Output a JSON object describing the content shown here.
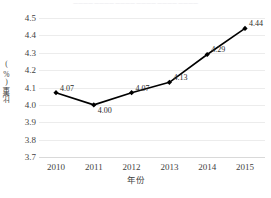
{
  "top_strip": {
    "text": "一一一一一一一一一一一一一一一一一一一一一一一一"
  },
  "chart_data": {
    "type": "line",
    "title": "",
    "subtitle": "",
    "xlabel": "年份",
    "ylabel": "比重(%)",
    "categories": [
      "2010",
      "2011",
      "2012",
      "2013",
      "2014",
      "2015"
    ],
    "x": [
      2010,
      2011,
      2012,
      2013,
      2014,
      2015
    ],
    "values": [
      4.07,
      4.0,
      4.07,
      4.13,
      4.29,
      4.44
    ],
    "point_labels": [
      "4.07",
      "4.00",
      "4.07",
      "4.13",
      "4.29",
      "4.44"
    ],
    "ylim": [
      3.7,
      4.5
    ],
    "ytick_labels": [
      "4.5",
      "4.4",
      "4.3",
      "4.2",
      "4.1",
      "4.0",
      "3.9",
      "3.8",
      "3.7"
    ],
    "ytick_values": [
      4.5,
      4.4,
      4.3,
      4.2,
      4.1,
      4.0,
      3.9,
      3.8,
      3.7
    ],
    "ytick_interval": 0.1,
    "grid": true,
    "grid_axis": "y",
    "legend": false,
    "legend_position": "none",
    "series_color": "#000000",
    "marker": "diamond",
    "marker_color": "#000000",
    "grid_color": "#ececec",
    "axis_color": "#d9d9d9",
    "background": "#ffffff"
  }
}
